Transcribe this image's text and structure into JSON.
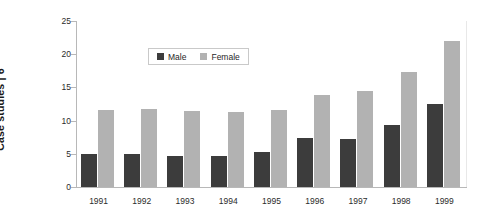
{
  "chart_data": {
    "type": "bar",
    "title": "",
    "xlabel": "",
    "ylabel": "Case studies | 6",
    "ylim": [
      0,
      25
    ],
    "yticks": [
      0,
      5,
      10,
      15,
      20,
      25
    ],
    "ytick_labels": [
      "0",
      "5",
      "10",
      "15",
      "20",
      "25"
    ],
    "grid": false,
    "legend_position": "top-center",
    "categories": [
      "1991",
      "1992",
      "1993",
      "1994",
      "1995",
      "1996",
      "1997",
      "1998",
      "1999"
    ],
    "series": [
      {
        "name": "Male",
        "color": "#3c3c3c",
        "values": [
          5.0,
          4.9,
          4.7,
          4.6,
          5.3,
          7.4,
          7.2,
          9.3,
          12.5
        ]
      },
      {
        "name": "Female",
        "color": "#b2b2b2",
        "values": [
          11.6,
          11.7,
          11.5,
          11.3,
          11.6,
          13.8,
          14.4,
          17.3,
          22.0
        ]
      }
    ]
  },
  "axis": {
    "y_title": "Case studies | 6",
    "line_color": "#b8b8b8"
  },
  "legend": {
    "entries": [
      {
        "label": "Male",
        "color": "#3c3c3c"
      },
      {
        "label": "Female",
        "color": "#b2b2b2"
      }
    ]
  }
}
